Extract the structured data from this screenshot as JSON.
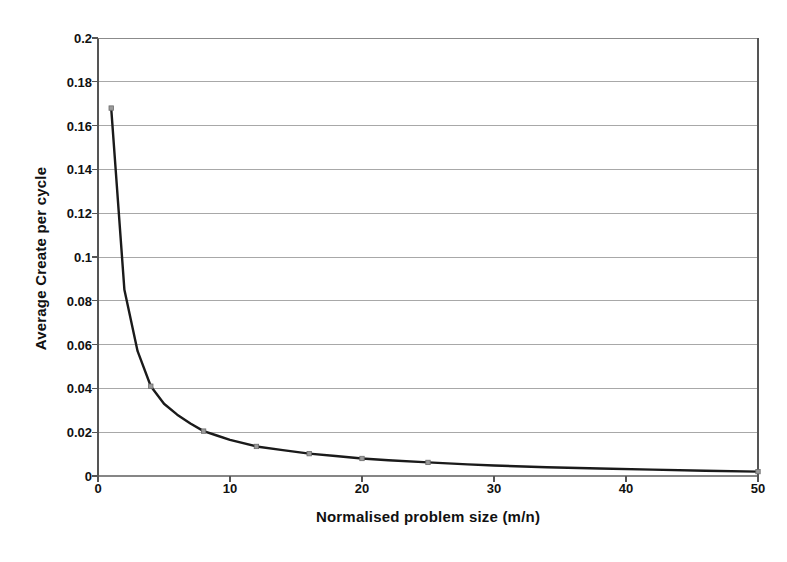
{
  "chart_data": {
    "type": "line",
    "title": "",
    "xlabel": "Normalised problem size (m/n)",
    "ylabel": "Average Create per cycle",
    "xlim": [
      0,
      50
    ],
    "ylim": [
      0,
      0.2
    ],
    "grid": "horizontal",
    "legend": "none",
    "marker": "small-square",
    "line_color": "#1a1a1a",
    "grid_color": "#808080",
    "axis_color": "#555555",
    "background_color": "#ffffff",
    "xticks": [
      0,
      10,
      20,
      30,
      40,
      50
    ],
    "xtick_labels": [
      "0",
      "10",
      "20",
      "30",
      "40",
      "50"
    ],
    "yticks": [
      0,
      0.02,
      0.04,
      0.06,
      0.08,
      0.1,
      0.12,
      0.14,
      0.16,
      0.18,
      0.2
    ],
    "ytick_labels": [
      "0",
      "0.02",
      "0.04",
      "0.06",
      "0.08",
      "0.1",
      "0.12",
      "0.14",
      "0.16",
      "0.18",
      "0.2"
    ],
    "series": [
      {
        "name": "Average Create per cycle",
        "x": [
          1,
          2,
          3,
          4,
          5,
          6,
          7,
          8,
          9,
          10,
          12,
          14,
          16,
          18,
          20,
          22,
          25,
          28,
          30,
          34,
          38,
          42,
          46,
          50
        ],
        "values": [
          0.168,
          0.085,
          0.057,
          0.041,
          0.033,
          0.028,
          0.024,
          0.0205,
          0.0185,
          0.0165,
          0.0135,
          0.0118,
          0.0102,
          0.0091,
          0.008,
          0.0072,
          0.0062,
          0.0053,
          0.0048,
          0.004,
          0.0034,
          0.0029,
          0.0024,
          0.002
        ]
      }
    ],
    "marker_points": [
      {
        "x": 1,
        "y": 0.168
      },
      {
        "x": 4,
        "y": 0.041
      },
      {
        "x": 8,
        "y": 0.0205
      },
      {
        "x": 12,
        "y": 0.0135
      },
      {
        "x": 16,
        "y": 0.0102
      },
      {
        "x": 20,
        "y": 0.008
      },
      {
        "x": 25,
        "y": 0.0062
      },
      {
        "x": 50,
        "y": 0.002
      }
    ]
  }
}
